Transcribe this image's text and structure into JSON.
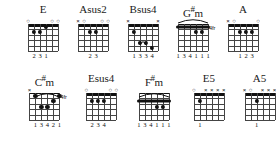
{
  "sheet": {
    "title": "Guitar Chord Diagrams",
    "background_color": "#ffffff",
    "ink_color": "#111111",
    "strings": 6,
    "frets": 5
  },
  "rows": [
    {
      "chords": [
        {
          "name": "E",
          "name_parts": [
            {
              "text": "E",
              "sharp": false
            }
          ],
          "left": 28,
          "width": 34,
          "grid_width": 30,
          "grid_height": 27,
          "nut": true,
          "fret_label": "",
          "markers": [
            {
              "string": 1,
              "type": "open"
            },
            {
              "string": 2,
              "type": "none"
            },
            {
              "string": 3,
              "type": "none"
            },
            {
              "string": 4,
              "type": "none"
            },
            {
              "string": 5,
              "type": "open"
            },
            {
              "string": 6,
              "type": "open"
            }
          ],
          "dots": [
            {
              "string": 2,
              "fret": 2
            },
            {
              "string": 3,
              "fret": 2
            },
            {
              "string": 4,
              "fret": 1
            }
          ],
          "barres": [],
          "arcs": [],
          "fingers": [
            {
              "string": 2,
              "text": "2"
            },
            {
              "string": 3,
              "text": "3"
            },
            {
              "string": 4,
              "text": "1"
            }
          ]
        },
        {
          "name": "Asus2",
          "name_parts": [
            {
              "text": "Asus2",
              "sharp": false
            }
          ],
          "left": 82,
          "width": 34,
          "grid_width": 30,
          "grid_height": 27,
          "nut": true,
          "fret_label": "",
          "markers": [
            {
              "string": 1,
              "type": "muted"
            },
            {
              "string": 2,
              "type": "open"
            },
            {
              "string": 3,
              "type": "none"
            },
            {
              "string": 4,
              "type": "none"
            },
            {
              "string": 5,
              "type": "open"
            },
            {
              "string": 6,
              "type": "open"
            }
          ],
          "dots": [
            {
              "string": 3,
              "fret": 2
            },
            {
              "string": 4,
              "fret": 2
            }
          ],
          "barres": [],
          "arcs": [],
          "fingers": [
            {
              "string": 3,
              "text": "2"
            },
            {
              "string": 4,
              "text": "3"
            }
          ]
        },
        {
          "name": "Bsus4",
          "name_parts": [
            {
              "text": "Bsus4",
              "sharp": false
            }
          ],
          "left": 136,
          "width": 34,
          "grid_width": 30,
          "grid_height": 27,
          "nut": true,
          "fret_label": "",
          "markers": [
            {
              "string": 1,
              "type": "muted"
            },
            {
              "string": 2,
              "type": "none"
            },
            {
              "string": 3,
              "type": "none"
            },
            {
              "string": 4,
              "type": "none"
            },
            {
              "string": 5,
              "type": "none"
            },
            {
              "string": 6,
              "type": "muted"
            }
          ],
          "dots": [
            {
              "string": 2,
              "fret": 2
            },
            {
              "string": 3,
              "fret": 4
            },
            {
              "string": 4,
              "fret": 4
            },
            {
              "string": 5,
              "fret": 5
            }
          ],
          "barres": [],
          "arcs": [
            {
              "from": 3,
              "to": 4,
              "fret": 4
            }
          ],
          "fingers": [
            {
              "string": 2,
              "text": "1"
            },
            {
              "string": 3,
              "text": "3"
            },
            {
              "string": 4,
              "text": "3"
            },
            {
              "string": 5,
              "text": "4"
            }
          ]
        },
        {
          "name": "G#m",
          "name_parts": [
            {
              "text": "G",
              "sharp": false
            },
            {
              "text": "#",
              "sharp": true
            },
            {
              "text": "m",
              "sharp": false
            }
          ],
          "left": 190,
          "width": 34,
          "grid_width": 30,
          "grid_height": 27,
          "nut": false,
          "fret_label": "4fr",
          "markers": [],
          "dots": [
            {
              "string": 4,
              "fret": 2
            },
            {
              "string": 5,
              "fret": 2
            }
          ],
          "barres": [
            {
              "from": 1,
              "to": 6,
              "fret": 1
            }
          ],
          "arcs": [
            {
              "from": 1,
              "to": 6,
              "fret": 0
            }
          ],
          "fingers": [
            {
              "string": 1,
              "text": "1"
            },
            {
              "string": 2,
              "text": "3"
            },
            {
              "string": 3,
              "text": "4"
            },
            {
              "string": 4,
              "text": "1"
            },
            {
              "string": 5,
              "text": "1"
            },
            {
              "string": 6,
              "text": "1"
            }
          ]
        },
        {
          "name": "A",
          "name_parts": [
            {
              "text": "A",
              "sharp": false
            }
          ],
          "left": 244,
          "width": 34,
          "grid_width": 30,
          "grid_height": 27,
          "nut": true,
          "fret_label": "",
          "markers": [
            {
              "string": 1,
              "type": "muted"
            },
            {
              "string": 2,
              "type": "open"
            },
            {
              "string": 3,
              "type": "none"
            },
            {
              "string": 4,
              "type": "none"
            },
            {
              "string": 5,
              "type": "none"
            },
            {
              "string": 6,
              "type": "open"
            }
          ],
          "dots": [
            {
              "string": 3,
              "fret": 2
            },
            {
              "string": 4,
              "fret": 2
            },
            {
              "string": 5,
              "fret": 2
            }
          ],
          "barres": [],
          "arcs": [],
          "fingers": [
            {
              "string": 3,
              "text": "1"
            },
            {
              "string": 4,
              "text": "2"
            },
            {
              "string": 5,
              "text": "3"
            }
          ]
        },
        {
          "name": "B",
          "name_parts": [
            {
              "text": "B",
              "sharp": false
            }
          ],
          "left": 298,
          "width": 34,
          "grid_width": 30,
          "grid_height": 27,
          "nut": true,
          "fret_label": "",
          "markers": [
            {
              "string": 1,
              "type": "muted"
            },
            {
              "string": 2,
              "type": "none"
            },
            {
              "string": 3,
              "type": "none"
            },
            {
              "string": 4,
              "type": "none"
            },
            {
              "string": 5,
              "type": "none"
            },
            {
              "string": 6,
              "type": "muted"
            }
          ],
          "dots": [
            {
              "string": 2,
              "fret": 2
            },
            {
              "string": 3,
              "fret": 4
            },
            {
              "string": 4,
              "fret": 4
            },
            {
              "string": 5,
              "fret": 4
            }
          ],
          "barres": [],
          "arcs": [
            {
              "from": 3,
              "to": 5,
              "fret": 4
            }
          ],
          "fingers": [
            {
              "string": 2,
              "text": "1"
            },
            {
              "string": 3,
              "text": "3"
            },
            {
              "string": 4,
              "text": "3"
            },
            {
              "string": 5,
              "text": "3"
            }
          ]
        }
      ]
    },
    {
      "chords": [
        {
          "name": "C#m",
          "name_parts": [
            {
              "text": "C",
              "sharp": false
            },
            {
              "text": "#",
              "sharp": true
            },
            {
              "text": "m",
              "sharp": false
            }
          ],
          "left": 28,
          "width": 34,
          "grid_width": 30,
          "grid_height": 27,
          "nut": false,
          "fret_label": "4fr",
          "markers": [
            {
              "string": 1,
              "type": "muted"
            },
            {
              "string": 2,
              "type": "none"
            },
            {
              "string": 3,
              "type": "none"
            },
            {
              "string": 4,
              "type": "none"
            },
            {
              "string": 5,
              "type": "none"
            },
            {
              "string": 6,
              "type": "none"
            }
          ],
          "dots": [
            {
              "string": 2,
              "fret": 1
            },
            {
              "string": 3,
              "fret": 3
            },
            {
              "string": 4,
              "fret": 3
            },
            {
              "string": 5,
              "fret": 2
            },
            {
              "string": 6,
              "fret": 1
            }
          ],
          "barres": [],
          "arcs": [
            {
              "from": 2,
              "to": 6,
              "fret": 1
            }
          ],
          "fingers": [
            {
              "string": 2,
              "text": "1"
            },
            {
              "string": 3,
              "text": "3"
            },
            {
              "string": 4,
              "text": "4"
            },
            {
              "string": 5,
              "text": "2"
            },
            {
              "string": 6,
              "text": "1"
            }
          ]
        },
        {
          "name": "Esus4",
          "name_parts": [
            {
              "text": "Esus4",
              "sharp": false
            }
          ],
          "left": 86,
          "width": 34,
          "grid_width": 30,
          "grid_height": 27,
          "nut": true,
          "fret_label": "",
          "markers": [
            {
              "string": 1,
              "type": "open"
            },
            {
              "string": 2,
              "type": "none"
            },
            {
              "string": 3,
              "type": "none"
            },
            {
              "string": 4,
              "type": "none"
            },
            {
              "string": 5,
              "type": "open"
            },
            {
              "string": 6,
              "type": "open"
            }
          ],
          "dots": [
            {
              "string": 2,
              "fret": 2
            },
            {
              "string": 3,
              "fret": 2
            },
            {
              "string": 4,
              "fret": 2
            }
          ],
          "barres": [],
          "arcs": [],
          "fingers": [
            {
              "string": 2,
              "text": "2"
            },
            {
              "string": 3,
              "text": "3"
            },
            {
              "string": 4,
              "text": "4"
            }
          ]
        },
        {
          "name": "F#m",
          "name_parts": [
            {
              "text": "F",
              "sharp": false
            },
            {
              "text": "#",
              "sharp": true
            },
            {
              "text": "m",
              "sharp": false
            }
          ],
          "left": 140,
          "width": 34,
          "grid_width": 30,
          "grid_height": 27,
          "nut": false,
          "fret_label": "",
          "markers": [],
          "dots": [
            {
              "string": 4,
              "fret": 3
            },
            {
              "string": 5,
              "fret": 3
            }
          ],
          "barres": [
            {
              "from": 1,
              "to": 6,
              "fret": 2
            }
          ],
          "arcs": [
            {
              "from": 1,
              "to": 6,
              "fret": 1
            }
          ],
          "fingers": [
            {
              "string": 1,
              "text": "1"
            },
            {
              "string": 2,
              "text": "3"
            },
            {
              "string": 3,
              "text": "4"
            },
            {
              "string": 4,
              "text": "1"
            },
            {
              "string": 5,
              "text": "1"
            },
            {
              "string": 6,
              "text": "1"
            }
          ]
        },
        {
          "name": "E5",
          "name_parts": [
            {
              "text": "E5",
              "sharp": false
            }
          ],
          "left": 196,
          "width": 34,
          "grid_width": 30,
          "grid_height": 27,
          "nut": true,
          "fret_label": "",
          "markers": [
            {
              "string": 1,
              "type": "open"
            },
            {
              "string": 2,
              "type": "none"
            },
            {
              "string": 3,
              "type": "muted"
            },
            {
              "string": 4,
              "type": "muted"
            },
            {
              "string": 5,
              "type": "muted"
            },
            {
              "string": 6,
              "type": "muted"
            }
          ],
          "dots": [
            {
              "string": 2,
              "fret": 2
            }
          ],
          "barres": [],
          "arcs": [],
          "fingers": [
            {
              "string": 2,
              "text": "1"
            }
          ]
        },
        {
          "name": "A5",
          "name_parts": [
            {
              "text": "A5",
              "sharp": false
            }
          ],
          "left": 248,
          "width": 34,
          "grid_width": 30,
          "grid_height": 27,
          "nut": true,
          "fret_label": "",
          "markers": [
            {
              "string": 1,
              "type": "muted"
            },
            {
              "string": 2,
              "type": "open"
            },
            {
              "string": 3,
              "type": "none"
            },
            {
              "string": 4,
              "type": "muted"
            },
            {
              "string": 5,
              "type": "muted"
            },
            {
              "string": 6,
              "type": "muted"
            }
          ],
          "dots": [
            {
              "string": 3,
              "fret": 2
            }
          ],
          "barres": [],
          "arcs": [],
          "fingers": [
            {
              "string": 3,
              "text": "1"
            }
          ]
        }
      ]
    }
  ]
}
